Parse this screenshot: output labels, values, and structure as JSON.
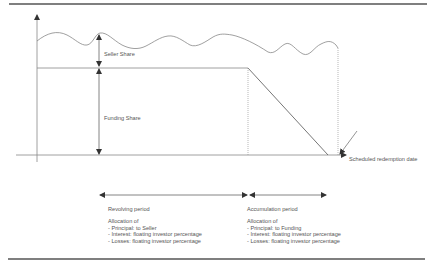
{
  "diagram": {
    "labels": {
      "seller_share": "Seller Share",
      "funding_share": "Funding Share",
      "scheduled_redemption": "Scheduled redemption date"
    },
    "periods": [
      {
        "name": "Revolving period",
        "allocation_heading": "Allocation of",
        "items": [
          "- Principal: to Seller",
          "- Interest: floating investor percentage",
          "- Losses: floating investor percentage"
        ]
      },
      {
        "name": "Accumulation period",
        "allocation_heading": "Allocation of",
        "items": [
          "- Principal: to Funding",
          "- Interest: floating investor percentage",
          "- Losses: floating investor percentage"
        ]
      }
    ],
    "colors": {
      "line": "#777777",
      "rule": "#555555",
      "text": "#555555"
    }
  }
}
